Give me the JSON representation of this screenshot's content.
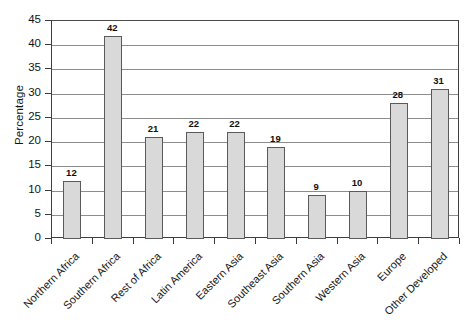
{
  "chart_data": {
    "type": "bar",
    "title": "",
    "xlabel": "",
    "ylabel": "Percentage",
    "ylim": [
      0,
      45
    ],
    "ytick_step": 5,
    "yticks": [
      45,
      40,
      35,
      30,
      25,
      20,
      15,
      10,
      5,
      0
    ],
    "grid": true,
    "legend": false,
    "bar_color": "#d9d9d9",
    "bar_border_color": "#5a5a5a",
    "gridline_color": "#8d8d8d",
    "axis_color": "#3f3f3f",
    "categories": [
      "Northern Africa",
      "Southern Africa",
      "Rest of Africa",
      "Latin America",
      "Eastern Asia",
      "Southeast Asia",
      "Southern Asia",
      "Western Asia",
      "Europe",
      "Other Developed"
    ],
    "values": [
      12,
      42,
      21,
      22,
      22,
      19,
      9,
      10,
      28,
      31
    ],
    "value_labels": [
      "12",
      "42",
      "21",
      "22",
      "22",
      "19",
      "9",
      "10",
      "28",
      "31"
    ],
    "x_label_rotation": -45
  }
}
